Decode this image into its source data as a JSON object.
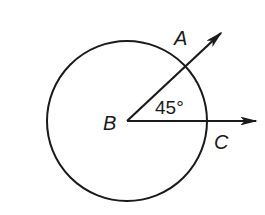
{
  "diagram": {
    "type": "geometry-angle-in-circle",
    "colors": {
      "stroke": "#1a1a1a",
      "background": "#ffffff"
    },
    "circle": {
      "center": "B"
    },
    "points": {
      "A": {
        "label": "A"
      },
      "B": {
        "label": "B"
      },
      "C": {
        "label": "C"
      }
    },
    "rays": [
      {
        "from": "B",
        "through": "A",
        "arrow": true
      },
      {
        "from": "B",
        "through": "C",
        "arrow": true
      }
    ],
    "angle": {
      "vertex": "B",
      "between": [
        "A",
        "C"
      ],
      "label": "45°",
      "value_degrees": 45
    }
  }
}
